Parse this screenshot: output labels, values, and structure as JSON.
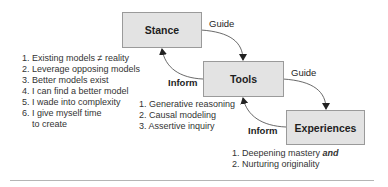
{
  "boxes": {
    "stance": "Stance",
    "tools": "Tools",
    "experiences": "Experiences"
  },
  "edges": {
    "stance_to_tools": "Guide",
    "tools_to_experiences": "Guide",
    "tools_to_stance": "Inform",
    "experiences_to_tools": "Inform"
  },
  "stance_list": [
    "1. Existing models ≠ reality",
    "2. Leverage opposing models",
    "3. Better models exist",
    "4. I can find a better model",
    "5. I wade into complexity",
    "6. I give myself time",
    "to create"
  ],
  "tools_list": [
    "1. Generative reasoning",
    "2. Causal modeling",
    "3. Assertive inquiry"
  ],
  "experiences_list": {
    "item1_text": "1. Deepening mastery ",
    "item1_emphasis": "and",
    "item2": "2. Nurturing originality"
  },
  "colors": {
    "box_fill": "#e3e3e3",
    "box_border": "#9a9a9a",
    "arrow": "#333333",
    "rule": "#b5b5b5"
  }
}
